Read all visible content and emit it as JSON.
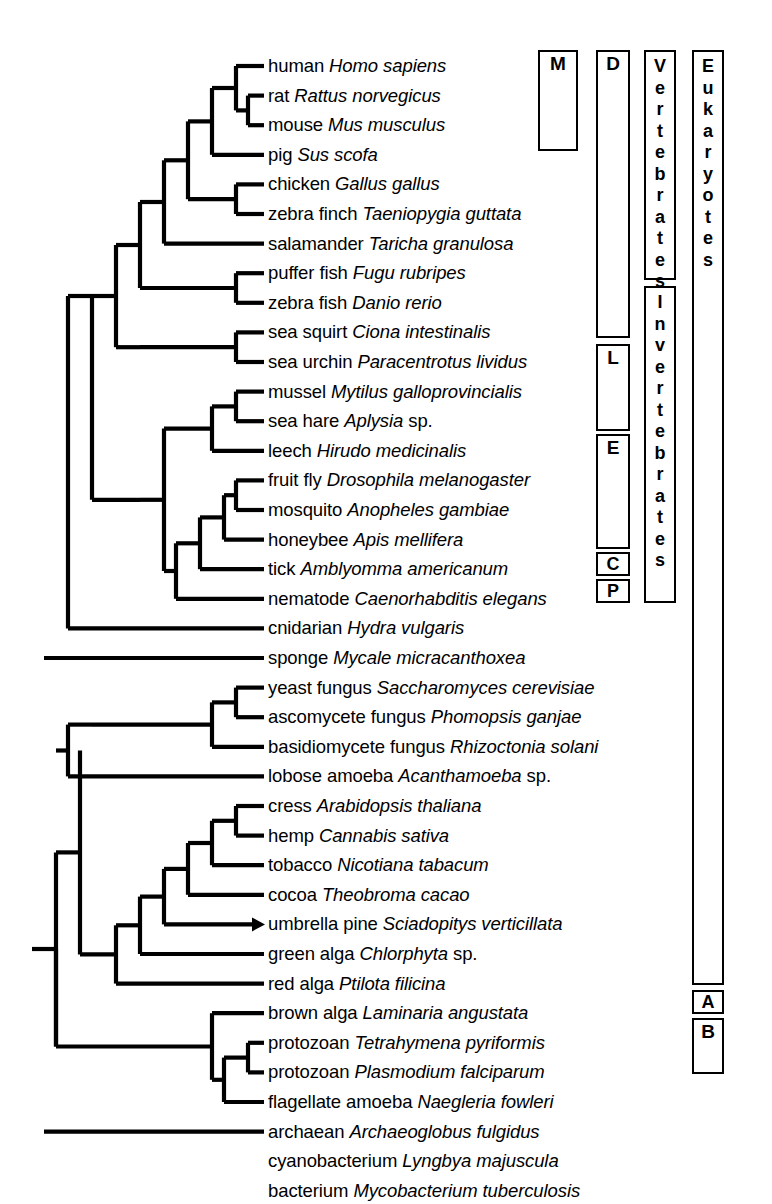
{
  "figure": {
    "type": "phylogenetic-tree-cladogram",
    "title": "",
    "row_spacing_px": 29.6,
    "first_row_y_px": 66,
    "label_x_px": 268,
    "stroke_color": "#000000",
    "background_color": "#ffffff"
  },
  "taxa": [
    {
      "index": 0,
      "common": "human ",
      "sci": "Homo sapiens"
    },
    {
      "index": 1,
      "common": "rat ",
      "sci": "Rattus  norvegicus"
    },
    {
      "index": 2,
      "common": "mouse ",
      "sci": "Mus musculus"
    },
    {
      "index": 3,
      "common": "pig ",
      "sci": "Sus scofa"
    },
    {
      "index": 4,
      "common": "chicken ",
      "sci": "Gallus gallus"
    },
    {
      "index": 5,
      "common": "zebra finch ",
      "sci": "Taeniopygia guttata"
    },
    {
      "index": 6,
      "common": "salamander ",
      "sci": "Taricha granulosa"
    },
    {
      "index": 7,
      "common": "puffer fish ",
      "sci": "Fugu rubripes"
    },
    {
      "index": 8,
      "common": "zebra fish ",
      "sci": "Danio rerio"
    },
    {
      "index": 9,
      "common": "sea squirt ",
      "sci": "Ciona intestinalis"
    },
    {
      "index": 10,
      "common": "sea urchin ",
      "sci": "Paracentrotus lividus"
    },
    {
      "index": 11,
      "common": "mussel ",
      "sci": "Mytilus galloprovincialis"
    },
    {
      "index": 12,
      "common": "sea hare ",
      "sci": "Aplysia",
      "suffix": " sp."
    },
    {
      "index": 13,
      "common": "leech ",
      "sci": "Hirudo medicinalis"
    },
    {
      "index": 14,
      "common": "fruit fly ",
      "sci": "Drosophila melanogaster"
    },
    {
      "index": 15,
      "common": "mosquito ",
      "sci": "Anopheles gambiae"
    },
    {
      "index": 16,
      "common": "honeybee ",
      "sci": "Apis mellifera"
    },
    {
      "index": 17,
      "common": "tick ",
      "sci": "Amblyomma americanum"
    },
    {
      "index": 18,
      "common": "nematode ",
      "sci": "Caenorhabditis elegans"
    },
    {
      "index": 19,
      "common": "cnidarian ",
      "sci": "Hydra vulgaris"
    },
    {
      "index": 20,
      "common": "sponge ",
      "sci": "Mycale micracanthoxea"
    },
    {
      "index": 21,
      "common": "yeast fungus ",
      "sci": "Saccharomyces cerevisiae"
    },
    {
      "index": 22,
      "common": "ascomycete fungus ",
      "sci": "Phomopsis ganjae"
    },
    {
      "index": 23,
      "common": "basidiomycete fungus ",
      "sci": "Rhizoctonia solani"
    },
    {
      "index": 24,
      "common": "lobose amoeba ",
      "sci": "Acanthamoeba",
      "suffix": " sp."
    },
    {
      "index": 25,
      "common": "cress ",
      "sci": "Arabidopsis thaliana"
    },
    {
      "index": 26,
      "common": "hemp ",
      "sci": "Cannabis sativa"
    },
    {
      "index": 27,
      "common": "tobacco ",
      "sci": "Nicotiana tabacum"
    },
    {
      "index": 28,
      "common": "cocoa ",
      "sci": "Theobroma cacao"
    },
    {
      "index": 29,
      "common": "umbrella pine ",
      "sci": "Sciadopitys verticillata"
    },
    {
      "index": 30,
      "common": "green alga ",
      "sci": "Chlorphyta",
      "suffix": " sp."
    },
    {
      "index": 31,
      "common": "red alga ",
      "sci": "Ptilota filicina"
    },
    {
      "index": 32,
      "common": "brown alga ",
      "sci": "Laminaria angustata"
    },
    {
      "index": 33,
      "common": "protozoan ",
      "sci": "Tetrahymena pyriformis"
    },
    {
      "index": 34,
      "common": "protozoan ",
      "sci": "Plasmodium falciparum"
    },
    {
      "index": 35,
      "common": "flagellate amoeba ",
      "sci": "Naegleria fowleri"
    },
    {
      "index": 36,
      "common": "archaean ",
      "sci": "Archaeoglobus fulgidus"
    },
    {
      "index": 37,
      "common": "cyanobacterium ",
      "sci": "Lyngbya majuscula"
    },
    {
      "index": 38,
      "common": "bacterium ",
      "sci": "Mycobacterium tuberculosis"
    }
  ],
  "group_boxes": [
    {
      "id": "M",
      "label": "M",
      "orientation": "horizontal",
      "x": 538,
      "y": 50,
      "w": 40,
      "h": 101,
      "covers_rows": [
        0,
        3
      ]
    },
    {
      "id": "D",
      "label": "D",
      "orientation": "horizontal",
      "x": 596,
      "y": 50,
      "w": 34,
      "h": 288,
      "covers_rows": [
        0,
        10
      ]
    },
    {
      "id": "L",
      "label": "L",
      "orientation": "horizontal",
      "x": 596,
      "y": 344,
      "w": 34,
      "h": 87,
      "covers_rows": [
        11,
        13
      ]
    },
    {
      "id": "E",
      "label": "E",
      "orientation": "horizontal",
      "x": 596,
      "y": 434,
      "w": 34,
      "h": 115,
      "covers_rows": [
        14,
        18
      ]
    },
    {
      "id": "C",
      "label": "C",
      "orientation": "horizontal",
      "x": 596,
      "y": 552,
      "w": 34,
      "h": 24,
      "covers_rows": [
        19,
        19
      ]
    },
    {
      "id": "P",
      "label": "P",
      "orientation": "horizontal",
      "x": 596,
      "y": 579,
      "w": 34,
      "h": 24,
      "covers_rows": [
        20,
        20
      ]
    },
    {
      "id": "Vertebrates",
      "label": "Vertebrates",
      "orientation": "vertical",
      "x": 644,
      "y": 50,
      "w": 32,
      "h": 230,
      "covers_rows": [
        0,
        8
      ]
    },
    {
      "id": "Invertebrates",
      "label": "Invertebrates",
      "orientation": "vertical",
      "x": 644,
      "y": 286,
      "w": 32,
      "h": 317,
      "covers_rows": [
        9,
        20
      ]
    },
    {
      "id": "Eukaryotes",
      "label": "Eukaryotes",
      "orientation": "vertical",
      "x": 692,
      "y": 50,
      "w": 32,
      "h": 935,
      "covers_rows": [
        0,
        35
      ]
    },
    {
      "id": "A",
      "label": "A",
      "orientation": "horizontal",
      "x": 692,
      "y": 990,
      "w": 32,
      "h": 24,
      "covers_rows": [
        36,
        36
      ]
    },
    {
      "id": "B",
      "label": "B",
      "orientation": "horizontal",
      "x": 692,
      "y": 1018,
      "w": 32,
      "h": 56,
      "covers_rows": [
        37,
        38
      ]
    }
  ],
  "markers": [
    {
      "name": "umbrella-pine-arrowhead",
      "row": 29,
      "shape": "triangle",
      "note": "small filled arrowhead at branch tip"
    }
  ]
}
